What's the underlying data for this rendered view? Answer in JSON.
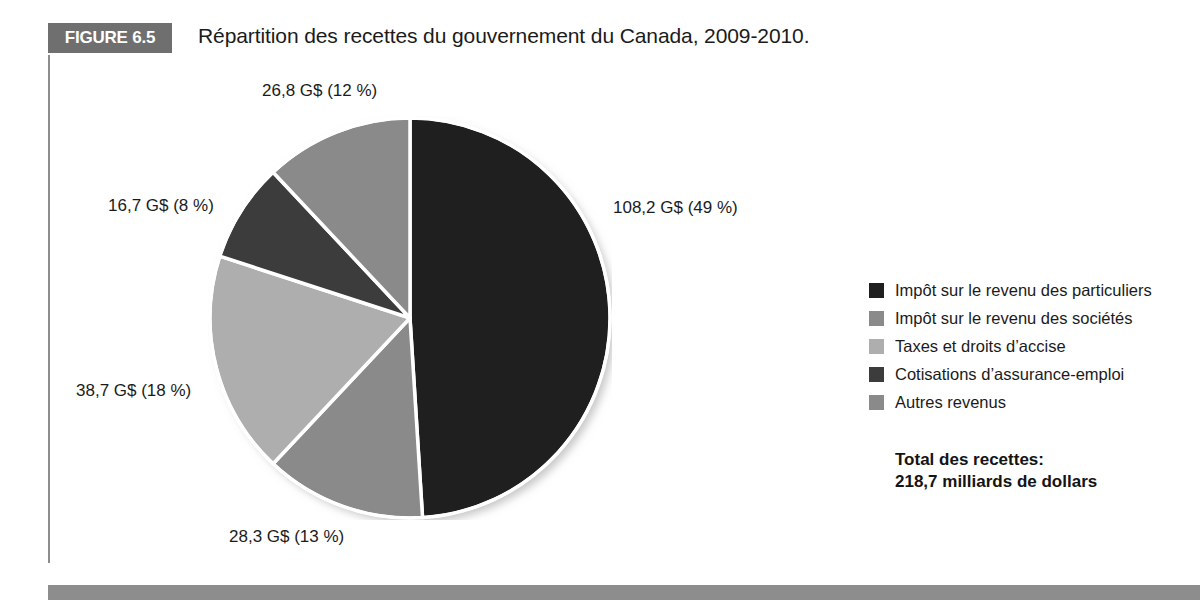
{
  "figure": {
    "badge_label": "FIGURE 6.5",
    "title": "Répartition des recettes du gouvernement du Canada, 2009-2010."
  },
  "legend": {
    "items": [
      {
        "label": "Impôt sur le revenu des particuliers",
        "color": "#1f1f1f"
      },
      {
        "label": "Impôt sur le revenu des sociétés",
        "color": "#8a8a8a"
      },
      {
        "label": "Taxes et droits d’accise",
        "color": "#aeaeae"
      },
      {
        "label": "Cotisations d’assurance-emploi",
        "color": "#3c3c3c"
      },
      {
        "label": "Autres revenus",
        "color": "#8a8a8a"
      }
    ]
  },
  "total": {
    "line1": "Total des recettes:",
    "line2": "218,7 milliards de dollars"
  },
  "chart_data": {
    "type": "pie",
    "title": "Répartition des recettes du gouvernement du Canada, 2009-2010.",
    "unit": "G$",
    "total_value": 218.7,
    "total_label": "218,7 milliards de dollars",
    "legend_position": "right",
    "grid": false,
    "categories": [
      "Impôt sur le revenu des particuliers",
      "Impôt sur le revenu des sociétés",
      "Taxes et droits d’accise",
      "Cotisations d’assurance-emploi",
      "Autres revenus"
    ],
    "values": [
      108.2,
      28.3,
      38.7,
      16.7,
      26.8
    ],
    "percentages": [
      49,
      13,
      18,
      8,
      12
    ],
    "colors": [
      "#1f1f1f",
      "#8a8a8a",
      "#aeaeae",
      "#3c3c3c",
      "#8a8a8a"
    ],
    "data_labels": [
      "108,2 G$ (49 %)",
      "28,3 G$ (13 %)",
      "38,7 G$ (18 %)",
      "16,7 G$ (8 %)",
      "26,8 G$ (12 %)"
    ]
  }
}
